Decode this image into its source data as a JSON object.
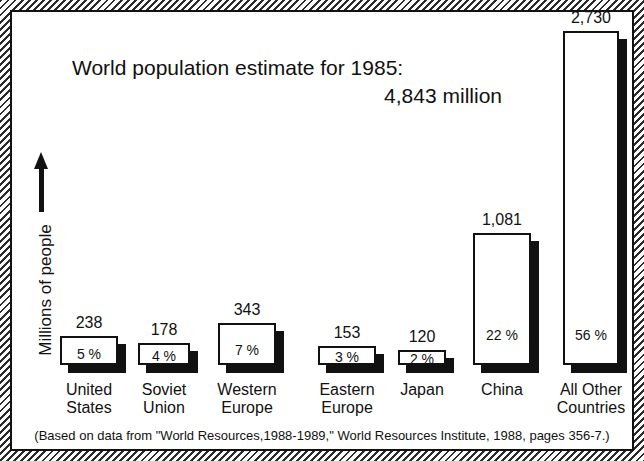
{
  "chart_data": {
    "type": "bar",
    "title": "World population estimate for 1985:",
    "subtitle": "4,843 million",
    "ylabel": "Millions of people",
    "xlabel": "",
    "grid": false,
    "legend": "none",
    "ylim": [
      0,
      2730
    ],
    "units": "millions of people",
    "categories": [
      "United States",
      "Soviet Union",
      "Western Europe",
      "Eastern Europe",
      "Japan",
      "China",
      "All Other Countries"
    ],
    "values": [
      238,
      178,
      343,
      153,
      120,
      1081,
      2730
    ],
    "value_labels": [
      "238",
      "178",
      "343",
      "153",
      "120",
      "1,081",
      "2,730"
    ],
    "percent_labels": [
      "5 %",
      "4 %",
      "7 %",
      "3 %",
      "2 %",
      "22 %",
      "56 %"
    ],
    "percents": [
      5,
      4,
      7,
      3,
      2,
      22,
      56
    ],
    "total_label": "4,843 million",
    "total": 4843,
    "year": 1985,
    "annotation": "(Based on data from \"World Resources,1988-1989,\" World Resources Institute, 1988, pages 356-7.)"
  },
  "axis": {
    "y_label": "Millions of people",
    "y_arrow_icon": "up-arrow-icon"
  },
  "bars": [
    {
      "value_label": "238",
      "pct_label": "5 %",
      "name_line1": "United",
      "name_line2": "States"
    },
    {
      "value_label": "178",
      "pct_label": "4 %",
      "name_line1": "Soviet",
      "name_line2": "Union"
    },
    {
      "value_label": "343",
      "pct_label": "7 %",
      "name_line1": "Western",
      "name_line2": "Europe"
    },
    {
      "value_label": "153",
      "pct_label": "3 %",
      "name_line1": "Eastern",
      "name_line2": "Europe"
    },
    {
      "value_label": "120",
      "pct_label": "2 %",
      "name_line1": "Japan",
      "name_line2": ""
    },
    {
      "value_label": "1,081",
      "pct_label": "22 %",
      "name_line1": "China",
      "name_line2": ""
    },
    {
      "value_label": "2,730",
      "pct_label": "56 %",
      "name_line1": "All Other",
      "name_line2": "Countries"
    }
  ],
  "caption": {
    "text": "(Based on data from \"World Resources,1988-1989,\" World Resources Institute, 1988, pages 356-7.)"
  },
  "colors": {
    "ink": "#111111",
    "paper": "#ffffff",
    "shadow": "#111111"
  }
}
